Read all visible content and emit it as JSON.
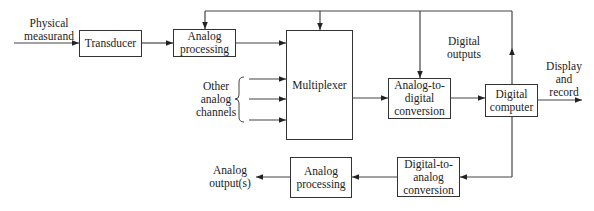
{
  "diagram": {
    "type": "block-diagram",
    "blocks": {
      "transducer": "Transducer",
      "analog_processing_in": "Analog\nprocessing",
      "multiplexer": "Multiplexer",
      "adc": "Analog-to-\ndigital\nconversion",
      "computer": "Digital\ncomputer",
      "dac": "Digital-to-\nanalog\nconversion",
      "analog_processing_out": "Analog\nprocessing"
    },
    "labels": {
      "input": "Physical\nmeasurand",
      "other_channels": "Other\nanalog\nchannels",
      "digital_outputs": "Digital\noutputs",
      "display": "Display\nand\nrecord",
      "analog_outputs": "Analog\noutput(s)"
    },
    "edges": [
      {
        "from": "Physical measurand",
        "to": "Transducer"
      },
      {
        "from": "Transducer",
        "to": "Analog processing"
      },
      {
        "from": "Analog processing",
        "to": "Multiplexer"
      },
      {
        "from": "Other analog channels",
        "to": "Multiplexer"
      },
      {
        "from": "Multiplexer",
        "to": "Analog-to-digital conversion"
      },
      {
        "from": "Analog-to-digital conversion",
        "to": "Digital computer"
      },
      {
        "from": "Digital computer",
        "to": "Display and record"
      },
      {
        "from": "Digital computer",
        "to": "Analog processing / Multiplexer / A-D (digital outputs control bus)"
      },
      {
        "from": "Digital computer",
        "to": "Digital-to-analog conversion"
      },
      {
        "from": "Digital-to-analog conversion",
        "to": "Analog processing (output)"
      },
      {
        "from": "Analog processing (output)",
        "to": "Analog output(s)"
      }
    ],
    "colors": {
      "line": "#333333",
      "background": "#ffffff"
    }
  }
}
